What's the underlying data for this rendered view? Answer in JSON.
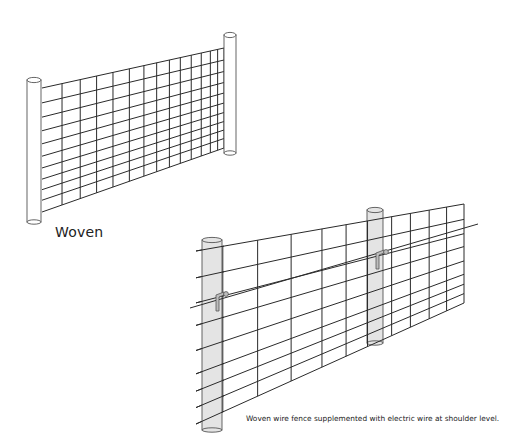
{
  "figure": {
    "title_label": "Woven",
    "caption": "Woven wire fence supplemented with electric wire at shoulder level."
  },
  "colors": {
    "background": "#ffffff",
    "wire": "#2a2a2a",
    "post_outline": "#555555",
    "post_fill_plain": "#ffffff",
    "post_fill_shaded": "#e4e4e4",
    "insulator_fill": "#bdbdbd"
  },
  "diagrams": [
    {
      "name": "woven-fence",
      "horizontal_wire_count": 11,
      "vertical_stay_count": 14,
      "posts": 2,
      "electric_wire": false
    },
    {
      "name": "woven-fence-with-electric-wire",
      "horizontal_wire_count": 8,
      "vertical_stay_count": 9,
      "posts": 2,
      "electric_wire": true,
      "insulators": 2
    }
  ]
}
